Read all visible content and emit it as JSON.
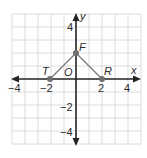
{
  "diagram": {
    "type": "coordinate-plane",
    "axes": {
      "x_label": "x",
      "y_label": "y",
      "range": [
        -5,
        5
      ],
      "x_ticks": [
        "−4",
        "−2",
        "2",
        "4"
      ],
      "y_ticks": [
        "4",
        "2",
        "−2",
        "−4"
      ]
    },
    "origin_label": "O",
    "points": [
      {
        "name": "T",
        "x": -2,
        "y": 0
      },
      {
        "name": "F",
        "x": 0,
        "y": 2
      },
      {
        "name": "R",
        "x": 2,
        "y": 0
      }
    ],
    "segments": [
      [
        "T",
        "F"
      ],
      [
        "F",
        "R"
      ]
    ],
    "colors": {
      "grid": "#d9d9d9",
      "axis": "#222222",
      "segment": "#7a7a7a",
      "point": "#6e6e6e"
    }
  }
}
